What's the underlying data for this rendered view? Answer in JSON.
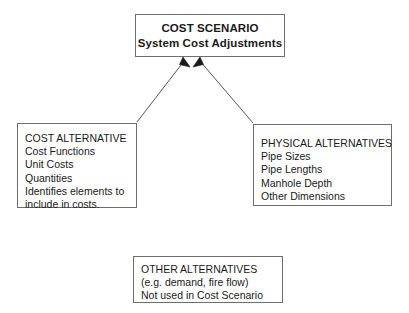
{
  "diagram": {
    "type": "block-flow-diagram",
    "background_color": "#ffffff",
    "box_border_color": "#6e6e6e",
    "connector_color": "#555555",
    "text_color": "#1a1a1a",
    "nodes": {
      "cost_scenario": {
        "title": "COST SCENARIO",
        "subtitle": "System Cost Adjustments"
      },
      "cost_alternative": {
        "heading": "COST ALTERNATIVE",
        "items": [
          "Cost Functions",
          "Unit Costs",
          "Quantities",
          "Identifies elements to",
          "include in costs."
        ]
      },
      "physical_alternatives": {
        "heading": "PHYSICAL ALTERNATIVES",
        "items": [
          "Pipe Sizes",
          "Pipe Lengths",
          "Manhole Depth",
          "Other Dimensions"
        ]
      },
      "other_alternatives": {
        "heading": "OTHER ALTERNATIVES",
        "items": [
          "(e.g. demand, fire flow)",
          "Not used in Cost Scenario"
        ]
      }
    },
    "connectors": [
      {
        "name": "cost-alternative-to-cost-scenario",
        "from": "cost_alternative",
        "to": "cost_scenario",
        "arrowhead": "filled-triangle"
      },
      {
        "name": "physical-alternatives-to-cost-scenario",
        "from": "physical_alternatives",
        "to": "cost_scenario",
        "arrowhead": "filled-triangle"
      }
    ]
  }
}
